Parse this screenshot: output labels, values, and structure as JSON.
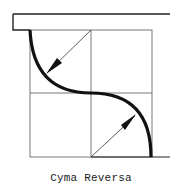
{
  "diagram": {
    "title": "Cyma Reversa",
    "elements": [
      "fillet-top",
      "grid-2x2",
      "s-curve-profile",
      "radius-arrow-upper",
      "radius-arrow-lower",
      "base-line"
    ]
  },
  "colors": {
    "ink": "#111111",
    "grid": "#555555",
    "background": "#ffffff"
  }
}
